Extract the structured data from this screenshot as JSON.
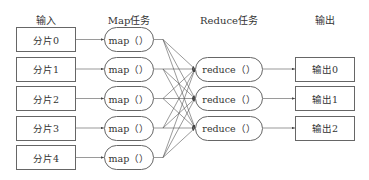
{
  "headers": {
    "input": "输入",
    "map": "Map任务",
    "reduce": "Reduce任务",
    "output": "输出"
  },
  "inputs": [
    "分片0",
    "分片1",
    "分片2",
    "分片3",
    "分片4"
  ],
  "maps": [
    "map（）",
    "map（）",
    "map（）",
    "map（）",
    "map（）"
  ],
  "reduces": [
    "reduce（）",
    "reduce（）",
    "reduce（）"
  ],
  "outputs": [
    "输出0",
    "输出1",
    "输出2"
  ],
  "colors": {
    "stroke": "#555555",
    "text": "#333333",
    "background": "#ffffff"
  }
}
